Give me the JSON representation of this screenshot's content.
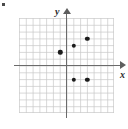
{
  "figure": {
    "corner_mark": "bullet-mark",
    "background_color": "#ffffff",
    "grid_color": "#c8c8c8",
    "axis_color": "#6b6b6b",
    "point_color": "#1c1c1c"
  },
  "axes": {
    "x_label": "x",
    "y_label": "y",
    "x_arrow": "arrow-right",
    "y_arrow": "arrow-up"
  },
  "chart_data": {
    "type": "scatter",
    "title": "",
    "xlabel": "x",
    "ylabel": "y",
    "xlim": [
      -7,
      7
    ],
    "ylim": [
      -7,
      7
    ],
    "grid": true,
    "legend": "none",
    "x_ticks": [],
    "y_ticks": [],
    "grid_step": 1,
    "points": [
      {
        "x": -1,
        "y": 2
      },
      {
        "x": 1,
        "y": 3
      },
      {
        "x": 3,
        "y": 4
      },
      {
        "x": 1,
        "y": -2
      },
      {
        "x": 3,
        "y": -2
      }
    ]
  }
}
